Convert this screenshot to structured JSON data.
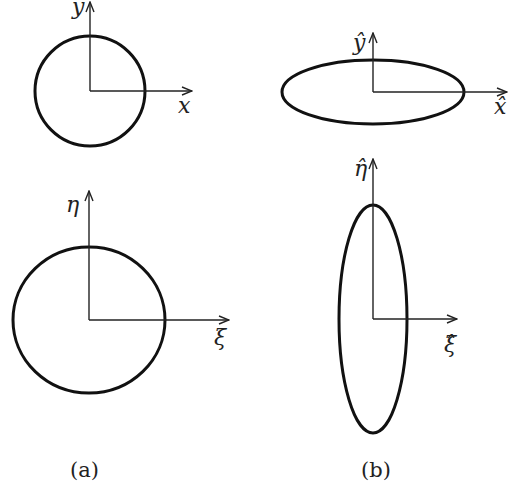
{
  "diagram": {
    "panels": [
      {
        "id": "a-top",
        "shape": "circle",
        "center": [
          90,
          91
        ],
        "rx": 55,
        "ry": 55,
        "axes": {
          "vertical": {
            "label": "y",
            "from": [
              90,
              91
            ],
            "to": [
              90,
              2
            ]
          },
          "horizontal": {
            "label": "x",
            "from": [
              90,
              91
            ],
            "to": [
              192,
              91
            ]
          }
        }
      },
      {
        "id": "a-bottom",
        "shape": "circle",
        "center": [
          89,
          320
        ],
        "rx": 76,
        "ry": 73,
        "axes": {
          "vertical": {
            "label": "η",
            "from": [
              89,
              320
            ],
            "to": [
              89,
              192
            ]
          },
          "horizontal": {
            "label": "ξ",
            "from": [
              89,
              320
            ],
            "to": [
              229,
              320
            ]
          }
        }
      },
      {
        "id": "b-top",
        "shape": "ellipse",
        "center": [
          373,
          92
        ],
        "rx": 91,
        "ry": 32,
        "axes": {
          "vertical": {
            "label": "ŷ",
            "from": [
              373,
              92
            ],
            "to": [
              373,
              34
            ]
          },
          "horizontal": {
            "label": "x̂",
            "from": [
              373,
              92
            ],
            "to": [
              507,
              92
            ]
          }
        }
      },
      {
        "id": "b-bottom",
        "shape": "ellipse",
        "center": [
          373,
          319
        ],
        "rx": 34,
        "ry": 114,
        "axes": {
          "vertical": {
            "label": "η̂",
            "from": [
              373,
              319
            ],
            "to": [
              373,
              160
            ]
          },
          "horizontal": {
            "label": "ξ̂",
            "from": [
              373,
              319
            ],
            "to": [
              457,
              319
            ]
          }
        }
      }
    ],
    "captions": {
      "a": "(a)",
      "b": "(b)"
    }
  },
  "colors": {
    "stroke": "#111111",
    "background": "#ffffff"
  }
}
